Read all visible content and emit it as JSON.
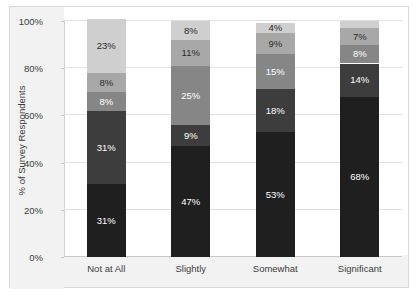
{
  "chart_data": {
    "type": "bar",
    "subtype": "stacked-bar-100",
    "title": "",
    "xlabel": "",
    "ylabel": "% of Survey Respondents",
    "ylim": [
      0,
      100
    ],
    "yticks": [
      "0%",
      "20%",
      "40%",
      "60%",
      "80%",
      "100%"
    ],
    "ytick_values": [
      0,
      20,
      40,
      60,
      80,
      100
    ],
    "grid": true,
    "legend": "none",
    "categories": [
      "Not at All",
      "Slightly",
      "Somewhat",
      "Significant"
    ],
    "series": [
      {
        "name": "Series 1",
        "color": "#1f1f1f",
        "label_color": "#ffffff",
        "values": [
          31,
          47,
          53,
          68
        ],
        "labels": [
          "31%",
          "47%",
          "53%",
          "68%"
        ]
      },
      {
        "name": "Series 2",
        "color": "#3d3d3d",
        "label_color": "#ffffff",
        "values": [
          31,
          9,
          18,
          14
        ],
        "labels": [
          "31%",
          "9%",
          "18%",
          "14%"
        ]
      },
      {
        "name": "Series 3",
        "color": "#868686",
        "label_color": "#ffffff",
        "values": [
          8,
          25,
          15,
          8
        ],
        "labels": [
          "8%",
          "25%",
          "15%",
          "8%"
        ]
      },
      {
        "name": "Series 4",
        "color": "#a8a8a8",
        "label_color": "#2b2b2b",
        "values": [
          8,
          11,
          9,
          7
        ],
        "labels": [
          "8%",
          "11%",
          "9%",
          "7%"
        ]
      },
      {
        "name": "Series 5",
        "color": "#cfcfcf",
        "label_color": "#2b2b2b",
        "values": [
          23,
          8,
          4,
          3
        ],
        "labels": [
          "23%",
          "8%",
          "4%",
          ""
        ]
      }
    ]
  }
}
